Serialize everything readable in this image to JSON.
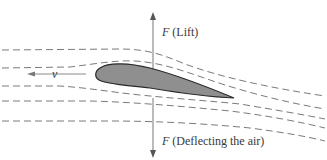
{
  "diagram": {
    "lift_label": {
      "symbol": "F",
      "text": "(Lift)"
    },
    "deflect_label": {
      "symbol": "F",
      "text": "(Deflecting the air)"
    },
    "velocity_label": "v",
    "colors": {
      "background": "#ffffff",
      "streamline": "#7a7a7a",
      "arrow": "#777777",
      "airfoil_fill": "#8f8f8f",
      "airfoil_stroke": "#2a2a2a",
      "text": "#3a3a3a"
    },
    "streamline_count": 5
  }
}
